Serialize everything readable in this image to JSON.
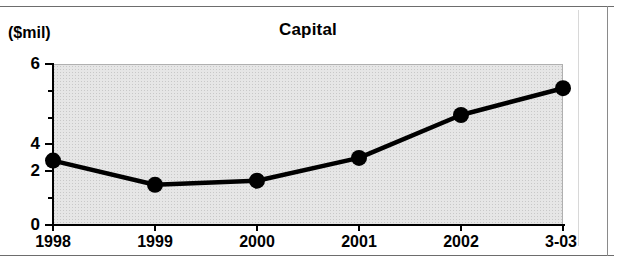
{
  "chart_data": {
    "type": "line",
    "title": "Capital",
    "unit_label": "($mil)",
    "xlabel": "",
    "ylabel": "",
    "categories": [
      "1998",
      "1999",
      "2000",
      "2001",
      "2002",
      "3-03"
    ],
    "values": [
      2.4,
      1.5,
      1.65,
      2.5,
      4.1,
      5.1
    ],
    "series": [
      {
        "name": "Capital",
        "values": [
          2.4,
          1.5,
          1.65,
          2.5,
          4.1,
          5.1
        ]
      }
    ],
    "ylim": [
      0,
      6
    ],
    "ytick_major": [
      "0",
      "2",
      "4",
      "6"
    ],
    "ytick_major_values": [
      0,
      2,
      4,
      6
    ],
    "ytick_minor_values": [
      1,
      3,
      5
    ],
    "grid": false,
    "legend": "none",
    "marker": "filled-circle",
    "line_color": "#000000",
    "marker_color": "#000000",
    "plot_background": "#e6e6e6",
    "page_background": "#ffffff"
  },
  "axis": {
    "y_labels": [
      "6",
      "4",
      "2",
      "0"
    ],
    "x_labels": [
      "1998",
      "1999",
      "2000",
      "2001",
      "2002",
      "3-03"
    ]
  }
}
